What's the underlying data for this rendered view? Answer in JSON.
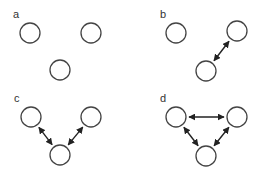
{
  "figure": {
    "stroke_color": "#444444",
    "arrow_color": "#222222",
    "node_radius": 10,
    "panels": [
      {
        "label": "a",
        "label_pos": [
          13,
          18
        ],
        "nodes": [
          [
            30,
            33
          ],
          [
            91,
            33
          ],
          [
            60,
            70
          ]
        ],
        "edges": []
      },
      {
        "label": "b",
        "label_pos": [
          160,
          18
        ],
        "nodes": [
          [
            176,
            33
          ],
          [
            237,
            31
          ],
          [
            206,
            71
          ]
        ],
        "edges": [
          [
            2,
            1
          ]
        ]
      },
      {
        "label": "c",
        "label_pos": [
          14,
          102
        ],
        "nodes": [
          [
            31,
            117
          ],
          [
            91,
            117
          ],
          [
            60,
            155
          ]
        ],
        "edges": [
          [
            0,
            2
          ],
          [
            1,
            2
          ]
        ]
      },
      {
        "label": "d",
        "label_pos": [
          160,
          102
        ],
        "nodes": [
          [
            176,
            117
          ],
          [
            237,
            117
          ],
          [
            206,
            156
          ]
        ],
        "edges": [
          [
            0,
            1
          ],
          [
            0,
            2
          ],
          [
            1,
            2
          ]
        ]
      }
    ]
  }
}
